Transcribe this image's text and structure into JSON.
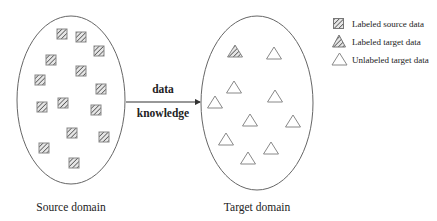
{
  "diagram": {
    "type": "transfer-learning-illustration",
    "source_domain": {
      "label": "Source domain",
      "ellipse": {
        "cx": 71,
        "cy": 100,
        "rx": 54,
        "ry": 84
      },
      "items_type": "labeled-source-square",
      "items": [
        {
          "x": 62,
          "y": 34
        },
        {
          "x": 81,
          "y": 37
        },
        {
          "x": 99,
          "y": 51
        },
        {
          "x": 51,
          "y": 60
        },
        {
          "x": 81,
          "y": 71
        },
        {
          "x": 40,
          "y": 80
        },
        {
          "x": 101,
          "y": 89
        },
        {
          "x": 42,
          "y": 107
        },
        {
          "x": 63,
          "y": 103
        },
        {
          "x": 96,
          "y": 110
        },
        {
          "x": 72,
          "y": 133
        },
        {
          "x": 104,
          "y": 137
        },
        {
          "x": 44,
          "y": 148
        },
        {
          "x": 74,
          "y": 163
        }
      ]
    },
    "target_domain": {
      "label": "Target domain",
      "ellipse": {
        "cx": 257,
        "cy": 103,
        "rx": 56,
        "ry": 87
      },
      "labeled_items": [
        {
          "x": 235,
          "y": 51
        }
      ],
      "unlabeled_items": [
        {
          "x": 274,
          "y": 53
        },
        {
          "x": 234,
          "y": 87
        },
        {
          "x": 275,
          "y": 96
        },
        {
          "x": 215,
          "y": 102
        },
        {
          "x": 250,
          "y": 120
        },
        {
          "x": 293,
          "y": 121
        },
        {
          "x": 226,
          "y": 139
        },
        {
          "x": 271,
          "y": 148
        },
        {
          "x": 248,
          "y": 158
        }
      ]
    },
    "arrow": {
      "label_top": "data",
      "label_bottom": "knowledge",
      "from": {
        "x": 126,
        "y": 102
      },
      "to": {
        "x": 201,
        "y": 102
      }
    },
    "legend": {
      "items": [
        {
          "icon": "hatched-square-icon",
          "label": "Labeled source data"
        },
        {
          "icon": "hatched-triangle-icon",
          "label": "Labeled target data"
        },
        {
          "icon": "outline-triangle-icon",
          "label": "Unlabeled target data"
        }
      ]
    },
    "colors": {
      "stroke": "#555555",
      "square_fill": "#d8d8d8",
      "hatch": "#555555",
      "triangle_stroke": "#777777"
    }
  }
}
